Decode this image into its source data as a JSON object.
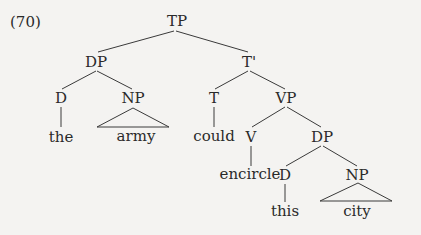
{
  "example_number": "(70)",
  "tree": {
    "nodes": {
      "tp": "TP",
      "dp_subj": "DP",
      "d_subj": "D",
      "np_subj": "NP",
      "the": "the",
      "army": "army",
      "tbar": "T'",
      "t": "T",
      "could": "could",
      "vp": "VP",
      "v": "V",
      "encircle": "encircle",
      "dp_obj": "DP",
      "d_obj": "D",
      "this": "this",
      "np_obj": "NP",
      "city": "city"
    }
  },
  "colors": {
    "line": "#3a3a3a",
    "background": "#f4f3f1"
  }
}
